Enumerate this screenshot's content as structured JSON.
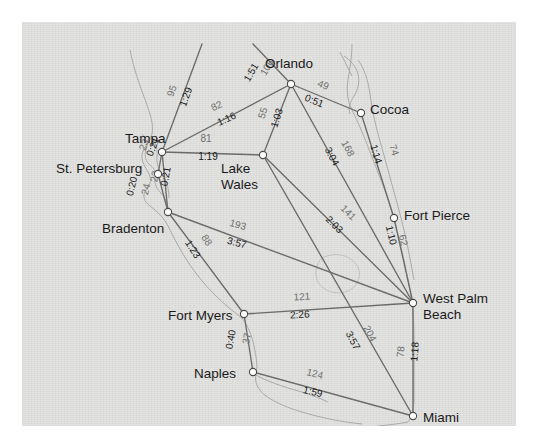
{
  "map": {
    "title": "Florida highway distance and driving-time map",
    "background_color": "#e3e3e1",
    "page_color": "#ffffff",
    "node_fill": "#ffffff",
    "node_stroke": "#4a4a4a",
    "edge_color": "#6b6b6b",
    "coast_color": "#9a9a98",
    "distance_label_color": "#6f6f6f",
    "time_label_color": "#191919"
  },
  "cities": [
    {
      "id": "orlando",
      "name": "Orlando",
      "x": 269,
      "y": 62,
      "label_x": 243,
      "label_y": 34,
      "lines": [
        "Orlando"
      ]
    },
    {
      "id": "cocoa",
      "name": "Cocoa",
      "x": 339,
      "y": 91,
      "label_x": 348,
      "label_y": 80,
      "lines": [
        "Cocoa"
      ]
    },
    {
      "id": "tampa",
      "name": "Tampa",
      "x": 140,
      "y": 130,
      "label_x": 103,
      "label_y": 109,
      "lines": [
        "Tampa"
      ]
    },
    {
      "id": "st_petersburg",
      "name": "St. Petersburg",
      "x": 136,
      "y": 152,
      "label_x": 34,
      "label_y": 139,
      "lines": [
        "St. Petersburg"
      ]
    },
    {
      "id": "lake_wales",
      "name": "Lake Wales",
      "x": 241,
      "y": 133,
      "label_x": 199,
      "label_y": 139,
      "lines": [
        "Lake",
        "Wales"
      ]
    },
    {
      "id": "fort_pierce",
      "name": "Fort Pierce",
      "x": 372,
      "y": 196,
      "label_x": 382,
      "label_y": 186,
      "lines": [
        "Fort Pierce"
      ]
    },
    {
      "id": "bradenton",
      "name": "Bradenton",
      "x": 146,
      "y": 190,
      "label_x": 80,
      "label_y": 199,
      "lines": [
        "Bradenton"
      ]
    },
    {
      "id": "west_palm",
      "name": "West Palm Beach",
      "x": 391,
      "y": 281,
      "label_x": 401,
      "label_y": 269,
      "lines": [
        "West Palm",
        "Beach"
      ]
    },
    {
      "id": "fort_myers",
      "name": "Fort Myers",
      "x": 222,
      "y": 292,
      "label_x": 146,
      "label_y": 286,
      "lines": [
        "Fort Myers"
      ]
    },
    {
      "id": "naples",
      "name": "Naples",
      "x": 231,
      "y": 350,
      "label_x": 172,
      "label_y": 344,
      "lines": [
        "Naples"
      ]
    },
    {
      "id": "miami",
      "name": "Miami",
      "x": 391,
      "y": 394,
      "label_x": 401,
      "label_y": 388,
      "lines": [
        "Miami"
      ]
    }
  ],
  "edges": [
    {
      "id": "tampa-north",
      "from": "tampa",
      "to": "off_north_west",
      "distance": "95",
      "time": "1:29",
      "x1": 140,
      "y1": 130,
      "x2": 180,
      "y2": 22,
      "dist_x": 153,
      "dist_y": 70,
      "dist_rot": -70,
      "time_x": 167,
      "time_y": 76,
      "time_rot": -70
    },
    {
      "id": "orlando-northwest",
      "from": "orlando",
      "to": "off_north",
      "distance": "106",
      "time": "1:51",
      "x1": 269,
      "y1": 62,
      "x2": 231,
      "y2": 22,
      "dist_x": 248,
      "dist_y": 47,
      "dist_rot": -60,
      "time_x": 232,
      "time_y": 52,
      "time_rot": -60
    },
    {
      "id": "tampa-orlando",
      "from": "tampa",
      "to": "orlando",
      "distance": "82",
      "time": "1:16",
      "x1": 140,
      "y1": 130,
      "x2": 269,
      "y2": 62,
      "dist_x": 196,
      "dist_y": 87,
      "dist_rot": -25,
      "time_x": 206,
      "time_y": 100,
      "time_rot": -25
    },
    {
      "id": "tampa-lakewales",
      "from": "tampa",
      "to": "lake_wales",
      "distance": "81",
      "time": "1:19",
      "x1": 140,
      "y1": 130,
      "x2": 241,
      "y2": 133,
      "dist_x": 184,
      "dist_y": 120,
      "dist_rot": 0,
      "time_x": 186,
      "time_y": 138,
      "time_rot": 0
    },
    {
      "id": "orlando-lakewales",
      "from": "orlando",
      "to": "lake_wales",
      "distance": "55",
      "time": "1:03",
      "x1": 269,
      "y1": 62,
      "x2": 241,
      "y2": 133,
      "dist_x": 244,
      "dist_y": 92,
      "dist_rot": -72,
      "time_x": 258,
      "time_y": 97,
      "time_rot": -72
    },
    {
      "id": "orlando-cocoa",
      "from": "orlando",
      "to": "cocoa",
      "distance": "49",
      "time": "0:51",
      "x1": 269,
      "y1": 62,
      "x2": 339,
      "y2": 91,
      "dist_x": 300,
      "dist_y": 66,
      "dist_rot": 22,
      "time_x": 291,
      "time_y": 82,
      "time_rot": 22
    },
    {
      "id": "orlando-westpalm",
      "from": "orlando",
      "to": "west_palm",
      "distance": "168",
      "time": "3:04",
      "x1": 269,
      "y1": 62,
      "x2": 391,
      "y2": 281,
      "dist_x": 323,
      "dist_y": 128,
      "dist_rot": 62,
      "time_x": 307,
      "time_y": 136,
      "time_rot": 62
    },
    {
      "id": "cocoa-fortpierce",
      "from": "cocoa",
      "to": "fort_pierce",
      "distance": "74",
      "time": "1:14",
      "x1": 339,
      "y1": 91,
      "x2": 372,
      "y2": 196,
      "dist_x": 369,
      "dist_y": 129,
      "dist_rot": 73,
      "time_x": 351,
      "time_y": 133,
      "time_rot": 73
    },
    {
      "id": "lakewales-westpalm",
      "from": "lake_wales",
      "to": "west_palm",
      "distance": "141",
      "time": "2:03",
      "x1": 241,
      "y1": 133,
      "x2": 391,
      "y2": 281,
      "dist_x": 324,
      "dist_y": 193,
      "dist_rot": 45,
      "time_x": 310,
      "time_y": 205,
      "time_rot": 45
    },
    {
      "id": "fortpierce-westpalm",
      "from": "fort_pierce",
      "to": "west_palm",
      "distance": "62",
      "time": "1:10",
      "x1": 372,
      "y1": 196,
      "x2": 391,
      "y2": 281,
      "dist_x": 378,
      "dist_y": 219,
      "dist_rot": 77,
      "time_x": 366,
      "time_y": 214,
      "time_rot": 77
    },
    {
      "id": "tampa-stpete",
      "from": "tampa",
      "to": "st_petersburg",
      "distance": "23",
      "time": "0:21",
      "x1": 140,
      "y1": 130,
      "x2": 136,
      "y2": 152,
      "dist_x": 125,
      "dist_y": 124,
      "dist_rot": -68,
      "time_x": 134,
      "time_y": 126,
      "time_rot": -68
    },
    {
      "id": "tampa-bradenton",
      "from": "tampa",
      "to": "bradenton",
      "distance": "23",
      "time": "0:21",
      "x1": 140,
      "y1": 130,
      "x2": 146,
      "y2": 190,
      "dist_x": 136,
      "dist_y": 155,
      "dist_rot": -80,
      "time_x": 147,
      "time_y": 155,
      "time_rot": -80
    },
    {
      "id": "stpete-bradenton",
      "from": "st_petersburg",
      "to": "bradenton",
      "distance": "24",
      "time": "0:20",
      "x1": 136,
      "y1": 152,
      "x2": 146,
      "y2": 190,
      "dist_x": 127,
      "dist_y": 168,
      "dist_rot": -76,
      "time_x": 113,
      "time_y": 165,
      "time_rot": -76
    },
    {
      "id": "bradenton-westpalm",
      "from": "bradenton",
      "to": "west_palm",
      "distance": "193",
      "time": "3:57",
      "x1": 146,
      "y1": 190,
      "x2": 391,
      "y2": 281,
      "dist_x": 215,
      "dist_y": 206,
      "dist_rot": 15,
      "time_x": 214,
      "time_y": 224,
      "time_rot": 15
    },
    {
      "id": "bradenton-fortmyers",
      "from": "bradenton",
      "to": "fort_myers",
      "distance": "88",
      "time": "1:23",
      "x1": 146,
      "y1": 190,
      "x2": 222,
      "y2": 292,
      "dist_x": 182,
      "dist_y": 220,
      "dist_rot": 57,
      "time_x": 168,
      "time_y": 229,
      "time_rot": 57
    },
    {
      "id": "fortmyers-westpalm",
      "from": "fort_myers",
      "to": "west_palm",
      "distance": "121",
      "time": "2:26",
      "x1": 222,
      "y1": 292,
      "x2": 391,
      "y2": 281,
      "dist_x": 280,
      "dist_y": 278,
      "dist_rot": -3,
      "time_x": 278,
      "time_y": 296,
      "time_rot": -3
    },
    {
      "id": "fortmyers-naples",
      "from": "fort_myers",
      "to": "naples",
      "distance": "37",
      "time": "0:40",
      "x1": 222,
      "y1": 292,
      "x2": 231,
      "y2": 350,
      "dist_x": 228,
      "dist_y": 317,
      "dist_rot": -80,
      "time_x": 212,
      "time_y": 318,
      "time_rot": -80
    },
    {
      "id": "lakewales-miami",
      "from": "lake_wales",
      "to": "miami",
      "distance": "204",
      "time": "3:57",
      "x1": 241,
      "y1": 133,
      "x2": 391,
      "y2": 394,
      "dist_x": 345,
      "dist_y": 313,
      "dist_rot": 62,
      "time_x": 328,
      "time_y": 320,
      "time_rot": 62
    },
    {
      "id": "naples-miami",
      "from": "naples",
      "to": "miami",
      "distance": "124",
      "time": "1:59",
      "x1": 231,
      "y1": 350,
      "x2": 391,
      "y2": 394,
      "dist_x": 292,
      "dist_y": 355,
      "dist_rot": 14,
      "time_x": 290,
      "time_y": 373,
      "time_rot": 14
    },
    {
      "id": "westpalm-miami",
      "from": "west_palm",
      "to": "miami",
      "distance": "78",
      "time": "1:18",
      "x1": 391,
      "y1": 281,
      "x2": 391,
      "y2": 394,
      "dist_x": 382,
      "dist_y": 330,
      "dist_rot": -85,
      "time_x": 396,
      "time_y": 330,
      "time_rot": -85
    }
  ]
}
